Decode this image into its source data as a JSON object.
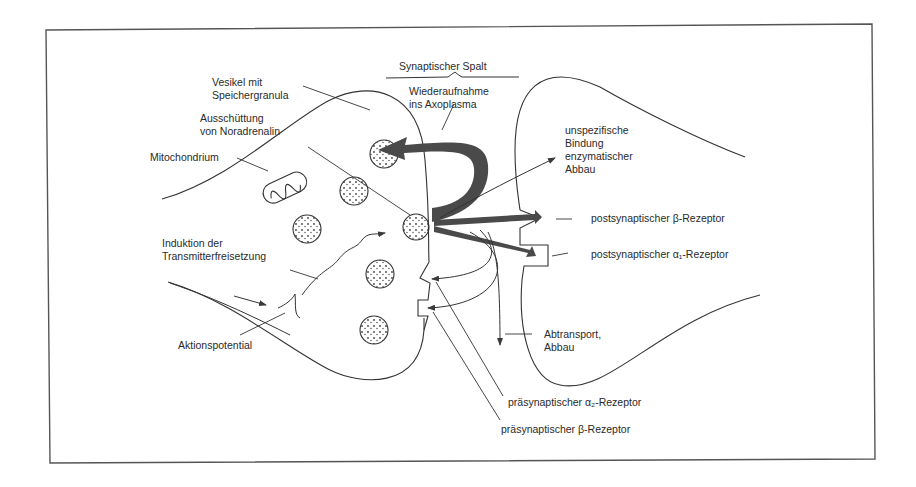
{
  "diagram": {
    "type": "synapse-schematic",
    "colors": {
      "line": "#3a3a3a",
      "arrow_fill": "#4a4a4a",
      "text": "#2a2a2a",
      "background": "#ffffff"
    },
    "labels": {
      "synaptic_cleft": "Synaptischer Spalt",
      "vesicle": "Vesikel mit\nSpeichergranula",
      "release": "Ausschüttung\nvon Noradrenalin",
      "mitochondrion": "Mitochondrium",
      "reuptake": "Wiederaufnahme\nins Axoplasma",
      "unspecific_binding": "unspezifische\nBindung\nenzymatischer\nAbbau",
      "post_beta": "postsynaptischer β-Rezeptor",
      "post_alpha1": "postsynaptischer α₁-Rezeptor",
      "induction": "Induktion der\nTransmitterfreisetzung",
      "action_potential": "Aktionspotential",
      "transport": "Abtransport,\nAbbau",
      "pre_alpha2": "präsynaptischer α₂-Rezeptor",
      "pre_beta": "präsynaptischer β-Rezeptor"
    },
    "nodes": [
      {
        "id": "presynaptic-terminal",
        "kind": "neuron-membrane"
      },
      {
        "id": "postsynaptic-membrane",
        "kind": "neuron-membrane"
      },
      {
        "id": "mitochondrion",
        "kind": "organelle"
      },
      {
        "id": "vesicle",
        "kind": "vesicle",
        "count": 6
      },
      {
        "id": "fusing-vesicle",
        "kind": "vesicle"
      },
      {
        "id": "post-beta-receptor",
        "kind": "receptor",
        "shape": "notch-triangle"
      },
      {
        "id": "post-alpha1-receptor",
        "kind": "receptor",
        "shape": "notch-square"
      },
      {
        "id": "pre-alpha2-receptor",
        "kind": "receptor",
        "shape": "notch-triangle"
      },
      {
        "id": "pre-beta-receptor",
        "kind": "receptor",
        "shape": "notch-square"
      }
    ],
    "edges": [
      {
        "from": "fusing-vesicle",
        "to": "presynaptic-terminal",
        "label": "Wiederaufnahme ins Axoplasma",
        "style": "thick-curved"
      },
      {
        "from": "fusing-vesicle",
        "to": "post-beta-receptor",
        "style": "thick"
      },
      {
        "from": "fusing-vesicle",
        "to": "post-alpha1-receptor",
        "style": "thick"
      },
      {
        "from": "fusing-vesicle",
        "to": "unspecific-binding",
        "style": "thin"
      },
      {
        "from": "fusing-vesicle",
        "to": "pre-alpha2-receptor",
        "style": "thin-curved"
      },
      {
        "from": "fusing-vesicle",
        "to": "pre-beta-receptor",
        "style": "thin-curved"
      },
      {
        "from": "fusing-vesicle",
        "to": "transport",
        "style": "thin"
      },
      {
        "from": "action-potential",
        "to": "fusing-vesicle",
        "label": "Induktion der Transmitterfreisetzung",
        "style": "wavy"
      }
    ]
  }
}
